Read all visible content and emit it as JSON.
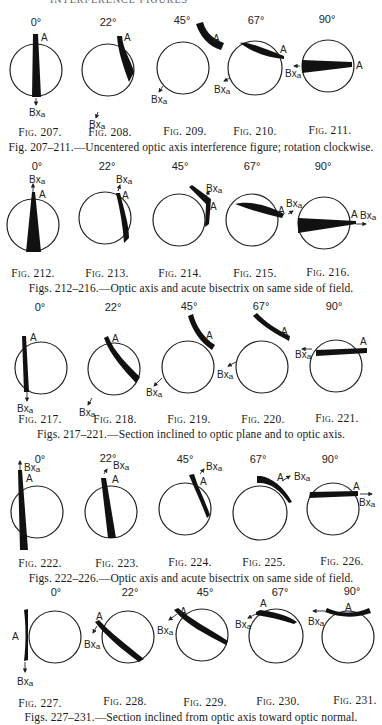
{
  "page": {
    "running_head": "INTERFERENCE FIGURES"
  },
  "rows": [
    {
      "caption": "Fig. 207–211.—Uncentered optic axis interference figure; rotation clockwise.",
      "figures": [
        {
          "fig": "Fig. 207.",
          "angle": "0°",
          "labels": [
            "A",
            "Bxa"
          ]
        },
        {
          "fig": "Fig. 208.",
          "angle": "22°",
          "labels": [
            "A",
            "Bxa"
          ]
        },
        {
          "fig": "Fig. 209.",
          "angle": "45°",
          "labels": [
            "A",
            "Bxa"
          ]
        },
        {
          "fig": "Fig. 210.",
          "angle": "67°",
          "labels": [
            "A",
            "Bxa"
          ]
        },
        {
          "fig": "Fig. 211.",
          "angle": "90°",
          "labels": [
            "A",
            "Bxa"
          ]
        }
      ]
    },
    {
      "caption": "Figs. 212–216.—Optic axis and acute bisectrix on same side of field.",
      "figures": [
        {
          "fig": "Fig. 212.",
          "angle": "0°",
          "labels": [
            "A",
            "Bxa"
          ]
        },
        {
          "fig": "Fig. 213.",
          "angle": "22°",
          "labels": [
            "A",
            "Bxa"
          ]
        },
        {
          "fig": "Fig. 214.",
          "angle": "45°",
          "labels": [
            "A",
            "Bxa"
          ]
        },
        {
          "fig": "Fig. 215.",
          "angle": "67°",
          "labels": [
            "A",
            "Bxa"
          ]
        },
        {
          "fig": "Fig. 216.",
          "angle": "90°",
          "labels": [
            "A",
            "Bxa"
          ]
        }
      ]
    },
    {
      "caption": "Figs. 217–221.—Section inclined to optic plane and to optic axis.",
      "figures": [
        {
          "fig": "Fig. 217.",
          "angle": "0°",
          "labels": [
            "A",
            "Bxa"
          ]
        },
        {
          "fig": "Fig. 218.",
          "angle": "22°",
          "labels": [
            "A",
            "Bxa"
          ]
        },
        {
          "fig": "Fig. 219.",
          "angle": "45°",
          "labels": [
            "A",
            "Bxa"
          ]
        },
        {
          "fig": "Fig. 220.",
          "angle": "67°",
          "labels": [
            "A",
            "Bxa"
          ]
        },
        {
          "fig": "Fig. 221.",
          "angle": "90°",
          "labels": [
            "A",
            "Bxa"
          ]
        }
      ]
    },
    {
      "caption": "Figs. 222–226.—Optic axis and acute bisectrix on same side of field.",
      "figures": [
        {
          "fig": "Fig. 222.",
          "angle": "0°",
          "labels": [
            "A",
            "Bxa"
          ]
        },
        {
          "fig": "Fig. 223.",
          "angle": "22°",
          "labels": [
            "A",
            "Bxa"
          ]
        },
        {
          "fig": "Fig. 224.",
          "angle": "45°",
          "labels": [
            "A",
            "Bxa"
          ]
        },
        {
          "fig": "Fig. 225.",
          "angle": "67°",
          "labels": [
            "A",
            "Bxa"
          ]
        },
        {
          "fig": "Fig. 226.",
          "angle": "90°",
          "labels": [
            "A",
            "Bxa"
          ]
        }
      ]
    },
    {
      "caption": "Figs. 227–231.—Section inclined from optic axis toward optic normal.",
      "figures": [
        {
          "fig": "Fig. 227.",
          "angle": "0°",
          "labels": [
            "A",
            "Bxa"
          ]
        },
        {
          "fig": "Fig. 228.",
          "angle": "22°",
          "labels": [
            "A",
            "Bxa"
          ]
        },
        {
          "fig": "Fig. 229.",
          "angle": "45°",
          "labels": [
            "A",
            "Bxa"
          ]
        },
        {
          "fig": "Fig. 230.",
          "angle": "67°",
          "labels": [
            "A",
            "Bxa"
          ]
        },
        {
          "fig": "Fig. 231.",
          "angle": "90°",
          "labels": [
            "A",
            "Bxa"
          ]
        }
      ]
    }
  ],
  "labels": {
    "axis": "A",
    "bisectrix": "Bxa"
  }
}
